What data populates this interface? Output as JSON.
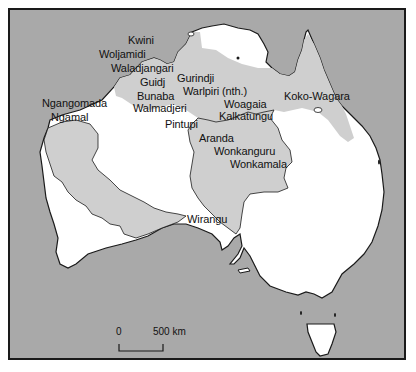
{
  "map": {
    "colors": {
      "ocean": "#a9a9a9",
      "land": "#ffffff",
      "language_region": "#cfcfcf",
      "outline": "#1a1a1a"
    },
    "labels": [
      {
        "id": "kwini",
        "text": "Kwini",
        "x": 126,
        "y": 33
      },
      {
        "id": "woljamidi",
        "text": "Woljamidi",
        "x": 97,
        "y": 46
      },
      {
        "id": "waladjangari",
        "text": "Waladjangari",
        "x": 109,
        "y": 60
      },
      {
        "id": "guidj",
        "text": "Guidj",
        "x": 138,
        "y": 74
      },
      {
        "id": "gurindji",
        "text": "Gurindji",
        "x": 175,
        "y": 70
      },
      {
        "id": "warlpiri-nth",
        "text": "Warlpiri (nth.)",
        "x": 181,
        "y": 83
      },
      {
        "id": "bunaba",
        "text": "Bunaba",
        "x": 135,
        "y": 87
      },
      {
        "id": "walmadjeri",
        "text": "Walmadjeri",
        "x": 131,
        "y": 99
      },
      {
        "id": "ngangomada",
        "text": "Ngangomada",
        "x": 40,
        "y": 94
      },
      {
        "id": "ngamal",
        "text": "Ngamal",
        "x": 49,
        "y": 108
      },
      {
        "id": "pintupi",
        "text": "Pintupi",
        "x": 163,
        "y": 115
      },
      {
        "id": "woagaia",
        "text": "Woagaia",
        "x": 222,
        "y": 94
      },
      {
        "id": "kalkatungu",
        "text": "Kalkatungu",
        "x": 217,
        "y": 107
      },
      {
        "id": "koko-wagara",
        "text": "Koko-Wagara",
        "x": 282,
        "y": 87
      },
      {
        "id": "aranda",
        "text": "Aranda",
        "x": 197,
        "y": 129
      },
      {
        "id": "wonkanguru",
        "text": "Wonkanguru",
        "x": 212,
        "y": 142
      },
      {
        "id": "wonkamala",
        "text": "Wonkamala",
        "x": 228,
        "y": 155
      },
      {
        "id": "wirangu",
        "text": "Wirangu",
        "x": 185,
        "y": 210
      }
    ],
    "scale_bar": {
      "start_label": "0",
      "end_label": "500 km"
    }
  }
}
